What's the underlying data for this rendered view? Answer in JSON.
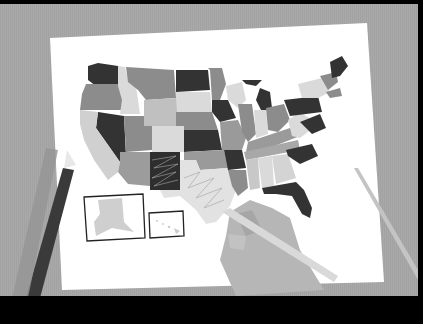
{
  "scene": {
    "description": "Grayscale illustration of a hand coloring a US map on paper with colored pencils",
    "colors": {
      "frame": "#000000",
      "table": "#a9a9a9",
      "paper": "#ffffff",
      "dark": "#333333",
      "mid": "#8c8c8c",
      "light": "#c8c8c8",
      "lighter": "#dadada",
      "pencil_dark": "#3a3a3a",
      "pencil_light": "#d4d4d4",
      "hand": "#b6b6b6"
    },
    "insets": [
      {
        "name": "alaska-inset"
      },
      {
        "name": "hawaii-inset"
      }
    ]
  }
}
